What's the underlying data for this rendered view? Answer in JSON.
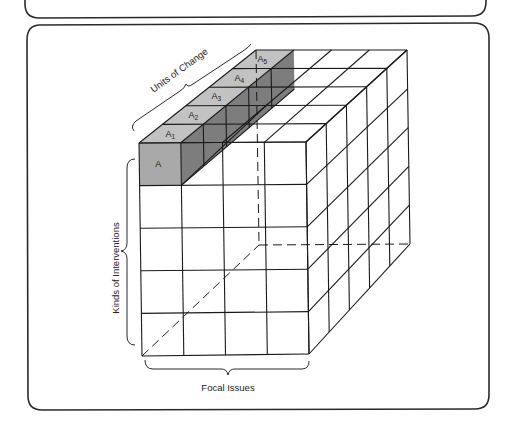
{
  "figure": {
    "type": "three-dimensional cube model",
    "axes": {
      "x": {
        "label": "Focal Issues",
        "divisions": 4
      },
      "y": {
        "label": "Kinds of Interventions",
        "divisions": 5
      },
      "z": {
        "label": "Units of Change",
        "divisions": 5
      }
    },
    "highlighted_row": {
      "front_cell_label": "A",
      "top_cell_labels": [
        {
          "base": "A",
          "sub": "1"
        },
        {
          "base": "A",
          "sub": "2"
        },
        {
          "base": "A",
          "sub": "3"
        },
        {
          "base": "A",
          "sub": "4"
        },
        {
          "base": "A",
          "sub": "5"
        }
      ]
    },
    "labels": {
      "units_of_change": "Units of Change",
      "kinds_of_interventions": "Kinds of Interventions",
      "focal_issues": "Focal Issues"
    }
  },
  "style": {
    "front_shade": "#a9a9a9",
    "top_shade": "#c2c2c2",
    "side_shade": "#7d7d7d",
    "line_color": "#1a1a1a"
  },
  "geometry": {
    "front": {
      "tl": [
        139,
        143
      ],
      "tr": [
        306,
        142
      ],
      "bl": [
        142,
        356
      ],
      "br": [
        309,
        354
      ]
    },
    "back": {
      "tl": [
        256,
        50
      ],
      "tr": [
        407,
        50
      ],
      "bl": [
        259,
        245
      ],
      "br": [
        410,
        244
      ]
    }
  }
}
